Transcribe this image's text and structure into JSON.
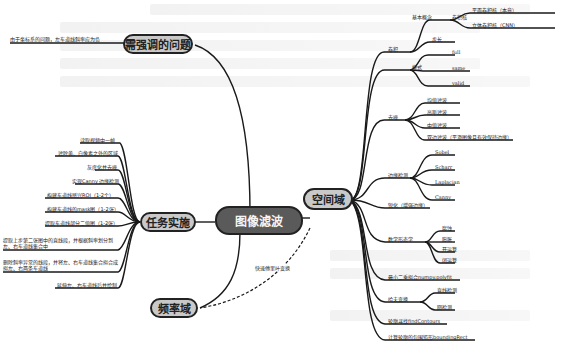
{
  "center": {
    "label": "图像滤波"
  },
  "main_nodes": {
    "spatial": {
      "label": "空间域"
    },
    "tasks": {
      "label": "任务实施"
    },
    "issues": {
      "label": "需强调的问题"
    },
    "frequency": {
      "label": "频率域"
    }
  },
  "edge_labels": {
    "fft": "快速傅里叶变换"
  },
  "issues": {
    "items": [
      "由于坐标系的问题，左车道线斜率应为负"
    ]
  },
  "tasks": {
    "items": [
      "读取视频中一帧",
      "滤除黄、白像素之外的区域",
      "灰度化并去噪",
      "实现Canny 边缘检测",
      "构建车道线感兴ROI（1-2个）",
      "构建车道线的mask图（1-2张）",
      "提取车道线部分二值图（1-2张）",
      "提取上步第二张图中的直线段，并根据斜率划分到左、右车道线集合中",
      "删除斜率异常的线段，并将左、右车道线集合拟合成拟左、右两条车道线",
      "延伸左、右车道线后并绘制"
    ]
  },
  "spatial": {
    "conv": {
      "label": "卷积",
      "basic": {
        "label": "基本概念",
        "kernel": {
          "label": "卷积核",
          "children": [
            "平面卷积核（本章）",
            "立体卷积核（CNN）"
          ]
        },
        "stride": "步长"
      },
      "mode": {
        "label": "模式",
        "children": [
          "full",
          "same",
          "valid"
        ]
      }
    },
    "denoise": {
      "label": "去噪",
      "children": [
        "均值滤波",
        "高斯滤波",
        "中值滤波",
        "双边滤波（平滑图像且有效保持边缘）"
      ]
    },
    "edge": {
      "label": "边缘检测",
      "children": [
        "Sobel",
        "Scharr",
        "Laplacian",
        "Canny"
      ]
    },
    "sharpen": {
      "label": "锐化（增强边缘）"
    },
    "morph": {
      "label": "数学形态学",
      "children": [
        "腐蚀",
        "膨胀",
        "开运算",
        "闭运算"
      ]
    },
    "lsq": {
      "label": "最小二乘拟合numpy.polyfit"
    },
    "hough": {
      "label": "哈夫变换",
      "children": [
        "直线检测",
        "圆检测"
      ]
    },
    "contour": {
      "label": "轮廓寻找findContours"
    },
    "bbox": {
      "label": "计算轮廓的包围矩形boundingRect"
    }
  }
}
